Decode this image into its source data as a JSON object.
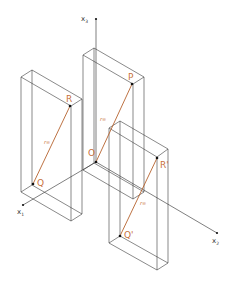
{
  "diagram": {
    "type": "3d-coordinate-translation",
    "colors": {
      "edge": "#3a3a3a",
      "vector": "#b5622e",
      "point_label": "#c8703a",
      "axis_label": "#333333"
    },
    "axes": {
      "x1": {
        "label": "x",
        "sub": "1"
      },
      "x2": {
        "label": "x",
        "sub": "2"
      },
      "x3": {
        "label": "x",
        "sub": "3"
      }
    },
    "points": {
      "origin": "O",
      "R": "R",
      "P": "P",
      "Q": "Q",
      "R_prime": "R'",
      "Q_prime": "Q'"
    },
    "vectors": {
      "left": "r∞",
      "middle": "r∞",
      "right": "r∞"
    }
  }
}
